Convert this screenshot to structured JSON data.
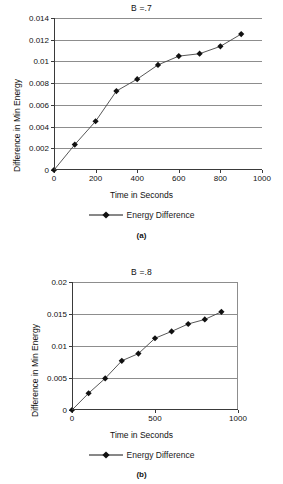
{
  "page": {
    "background": "#ffffff",
    "ink": "#111111",
    "grid_color": "#8d8d8d",
    "axis_color": "#3a3a3a"
  },
  "figures": [
    {
      "caption": "(a)",
      "legend_label": "Energy Difference",
      "chart": {
        "title": "B =.7",
        "xlabel": "Time in Seconds",
        "ylabel": "Difference in Min Energy",
        "xticks": [
          "0",
          "200",
          "400",
          "600",
          "800",
          "1000"
        ],
        "yticks": [
          "0",
          "0.002",
          "0.004",
          "0.006",
          "0.008",
          "0.01",
          "0.012",
          "0.014"
        ]
      }
    },
    {
      "caption": "(b)",
      "legend_label": "Energy Difference",
      "chart": {
        "title": "B =.8",
        "xlabel": "Time in Seconds",
        "ylabel": "Difference in Min Energy",
        "xticks": [
          "0",
          "500",
          "1000"
        ],
        "yticks": [
          "0",
          "0.005",
          "0.01",
          "0.015",
          "0.02"
        ]
      }
    }
  ],
  "chart_data": [
    {
      "type": "line",
      "title": "B =.7",
      "subtitle": "(a)",
      "xlabel": "Time in Seconds",
      "ylabel": "Difference in Min Energy",
      "xlim": [
        0,
        1000
      ],
      "ylim": [
        0,
        0.014
      ],
      "xticks": [
        0,
        200,
        400,
        600,
        800,
        1000
      ],
      "yticks": [
        0,
        0.002,
        0.004,
        0.006,
        0.008,
        0.01,
        0.012,
        0.014
      ],
      "grid": "horizontal",
      "legend": {
        "position": "below",
        "entries": [
          "Energy Difference"
        ]
      },
      "marker": "diamond",
      "series": [
        {
          "name": "Energy Difference",
          "x": [
            0,
            100,
            200,
            300,
            400,
            500,
            600,
            700,
            800,
            900
          ],
          "values": [
            0,
            0.00234,
            0.00449,
            0.00727,
            0.00837,
            0.00968,
            0.01049,
            0.01071,
            0.01139,
            0.01252
          ]
        }
      ]
    },
    {
      "type": "line",
      "title": "B =.8",
      "subtitle": "(b)",
      "xlabel": "Time in Seconds",
      "ylabel": "Difference in Min Energy",
      "xlim": [
        0,
        1000
      ],
      "ylim": [
        0,
        0.02
      ],
      "xticks": [
        0,
        500,
        1000
      ],
      "yticks": [
        0,
        0.005,
        0.01,
        0.015,
        0.02
      ],
      "grid": "horizontal",
      "legend": {
        "position": "below",
        "entries": [
          "Energy Difference"
        ]
      },
      "marker": "diamond",
      "series": [
        {
          "name": "Energy Difference",
          "x": [
            0,
            100,
            200,
            300,
            400,
            500,
            600,
            700,
            800,
            900
          ],
          "values": [
            0,
            0.00262,
            0.00494,
            0.00769,
            0.00881,
            0.01121,
            0.01228,
            0.01344,
            0.01415,
            0.01534
          ]
        }
      ]
    }
  ]
}
